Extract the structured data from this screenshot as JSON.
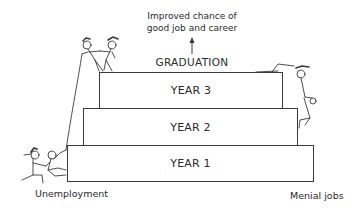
{
  "diagram": {
    "top_note": {
      "line1": "Improved chance of",
      "line2": "good job and career"
    },
    "graduation_label": "GRADUATION",
    "steps": [
      {
        "label": "YEAR 3"
      },
      {
        "label": "YEAR 2"
      },
      {
        "label": "YEAR 1"
      }
    ],
    "outcomes": {
      "left": "Unemployment",
      "right": "Menial jobs"
    },
    "figures": [
      {
        "description": "two stick figures on top-left of the steps"
      },
      {
        "description": "stick figure climbing off the right side of the steps"
      },
      {
        "description": "two stick figures pulling the rope at bottom-left"
      }
    ],
    "colors": {
      "line": "#3a3a3a",
      "text": "#2a2a2a",
      "background": "#ffffff"
    }
  }
}
